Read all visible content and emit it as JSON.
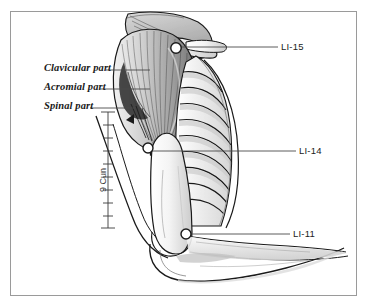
{
  "figure": {
    "background_color": "#ffffff",
    "border_color": "#9a9a9a",
    "ink_color": "#1a1a1a"
  },
  "muscle_labels": [
    {
      "id": "clavicular-part",
      "text": "Clavicular part",
      "x": 44,
      "y": 68,
      "leader_to_x": 130,
      "leader_to_y": 72
    },
    {
      "id": "acromial-part",
      "text": "Acromial part",
      "x": 44,
      "y": 87,
      "leader_to_x": 133,
      "leader_to_y": 90
    },
    {
      "id": "spinal-part",
      "text": "Spinal part",
      "x": 44,
      "y": 106,
      "leader_to_x": 128,
      "leader_to_y": 108
    }
  ],
  "acupoints": [
    {
      "id": "LI-15",
      "text": "LI-15",
      "label_x": 281,
      "label_y": 45,
      "marker_x": 176,
      "marker_y": 48,
      "leader_from_x": 278,
      "leader_from_y": 47
    },
    {
      "id": "LI-14",
      "text": "LI-14",
      "label_x": 299,
      "label_y": 149,
      "marker_x": 148,
      "marker_y": 148,
      "leader_from_x": 296,
      "leader_from_y": 151
    },
    {
      "id": "LI-11",
      "text": "LI-11",
      "label_x": 293,
      "label_y": 232,
      "marker_x": 186,
      "marker_y": 234,
      "leader_from_x": 290,
      "leader_from_y": 234
    }
  ],
  "measurement": {
    "id": "cun-scale",
    "text": "9 Cun",
    "units": 9,
    "axis_x": 108,
    "top_y": 112,
    "bottom_y": 228,
    "label_x": 98,
    "label_y": 188
  }
}
